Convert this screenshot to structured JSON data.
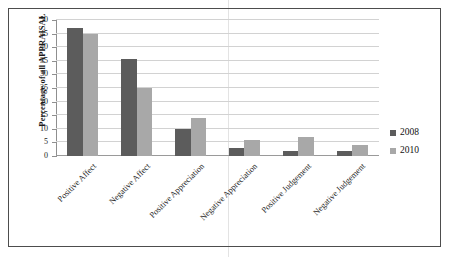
{
  "chart_data": {
    "type": "bar",
    "title": "",
    "xlabel": "",
    "ylabel": "Percentage of all APPRAISAL",
    "ylim": [
      0,
      50
    ],
    "ytick_step": 5,
    "yticks": [
      50,
      45,
      40,
      35,
      30,
      25,
      20,
      15,
      10,
      5,
      0
    ],
    "grid": true,
    "legend_position": "right",
    "categories": [
      "Positive Affect",
      "Negative Affect",
      "Positive Appreciation",
      "Negative Appreciation",
      "Positive Judgement",
      "Negative Judgement"
    ],
    "series": [
      {
        "name": "2008",
        "color": "#5c5c5c",
        "values": [
          47,
          35.5,
          10,
          3,
          2,
          2
        ]
      },
      {
        "name": "2010",
        "color": "#a8a8a8",
        "values": [
          45,
          25,
          14,
          6,
          7,
          4
        ]
      }
    ]
  },
  "legend": {
    "items": [
      {
        "label": "2008"
      },
      {
        "label": "2010"
      }
    ]
  }
}
